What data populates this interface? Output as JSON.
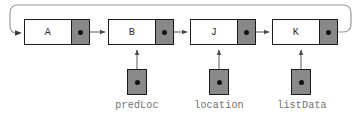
{
  "diagram": {
    "type": "linked-list",
    "colors": {
      "node_fill": "#ffffff",
      "pointer_cell_fill": "#888888",
      "pointer_box_fill": "#898989",
      "stroke": "#1a1a1a",
      "label_text": "#6f6f6f",
      "loop_line": "#8a8a8a",
      "connector_line": "#6a6a6a",
      "dot": "#111111"
    },
    "nodes": [
      {
        "id": "node-a",
        "label": "A",
        "x": 24,
        "y": 19,
        "width": 66,
        "height": 26
      },
      {
        "id": "node-b",
        "label": "B",
        "x": 108,
        "y": 19,
        "width": 66,
        "height": 26
      },
      {
        "id": "node-j",
        "label": "J",
        "x": 190,
        "y": 19,
        "width": 66,
        "height": 26
      },
      {
        "id": "node-k",
        "label": "K",
        "x": 272,
        "y": 19,
        "width": 66,
        "height": 26
      }
    ],
    "pointer_variables": [
      {
        "id": "ptr-predloc",
        "label": "predLoc",
        "target": "node-b",
        "box_x": 127,
        "box_y": 69,
        "label_x": 110,
        "label_y": 100
      },
      {
        "id": "ptr-location",
        "label": "location",
        "target": "node-j",
        "box_x": 209,
        "box_y": 69,
        "label_x": 189,
        "label_y": 100
      },
      {
        "id": "ptr-listdata",
        "label": "listData",
        "target": "node-k",
        "box_x": 291,
        "box_y": 69,
        "label_x": 274,
        "label_y": 100
      }
    ],
    "connections": [
      {
        "id": "link-a-b",
        "from": "node-a",
        "to": "node-b",
        "kind": "forward-arrow"
      },
      {
        "id": "link-b-j",
        "from": "node-b",
        "to": "node-j",
        "kind": "forward-arrow"
      },
      {
        "id": "link-j-k",
        "from": "node-j",
        "to": "node-k",
        "kind": "forward-arrow"
      },
      {
        "id": "link-k-a",
        "from": "node-k",
        "to": "node-a",
        "kind": "wrap-around-arrow"
      }
    ]
  }
}
